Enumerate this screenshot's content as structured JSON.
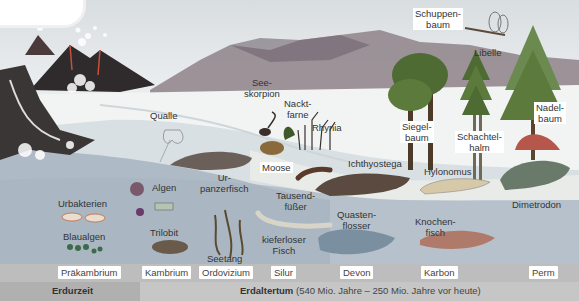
{
  "labels": {
    "qualle": "Qualle",
    "seeskorpion": "See-\nskorpion",
    "nacktfarne": "Nackt-\nfarne",
    "rhynia": "Rhynia",
    "moose": "Moose",
    "schuppenbaum": "Schuppen-\nbaum",
    "libelle": "Libelle",
    "siegelbaum": "Siegel-\nbaum",
    "schachtelhalm": "Schachtel-\nhalm",
    "nadelbaum": "Nadel-\nbaum",
    "urbakterien": "Urbakterien",
    "blaualgen": "Blaualgen",
    "algen": "Algen",
    "trilobit": "Trilobit",
    "urpanzerfisch": "Ur-\npanzerfisch",
    "seetang": "Seetang",
    "kieferloser_fisch": "kieferloser\nFisch",
    "tausendfuesser": "Tausend-\nfüßer",
    "ichthyostega": "Ichthyostega",
    "hylonomus": "Hylonomus",
    "dimetrodon": "Dimetrodon",
    "quastenflosser": "Quasten-\nflosser",
    "knochenfisch": "Knochen-\nfisch"
  },
  "periods": [
    {
      "name": "Präkambrium",
      "x": 58
    },
    {
      "name": "Kambrium",
      "x": 142
    },
    {
      "name": "Ordovizium",
      "x": 199
    },
    {
      "name": "Silur",
      "x": 271
    },
    {
      "name": "Devon",
      "x": 340
    },
    {
      "name": "Karbon",
      "x": 421
    },
    {
      "name": "Perm",
      "x": 529
    }
  ],
  "eras": {
    "erdurzeit": "Erdurzeit",
    "erdaltertum_bold": "Erdaltertum",
    "erdaltertum_range": " (540 Mio. Jahre – 250 Mio. Jahre vor heute)"
  },
  "colors": {
    "sea": "#aeb9c4",
    "land": "#e8eaea",
    "timebar": "#bdbdbd",
    "volcano": "#3a3434",
    "lava": "#c8503a",
    "mountain": "#8a7f86",
    "tree": "#5c7a3c"
  }
}
